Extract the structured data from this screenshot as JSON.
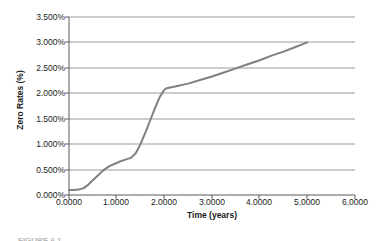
{
  "figure": {
    "caption_fragment": "FIGURE 6.1"
  },
  "chart_data": {
    "type": "line",
    "title": "",
    "xlabel": "Time (years)",
    "ylabel": "Zero Rates (%)",
    "xlim": [
      0.0,
      6.0
    ],
    "ylim": [
      0.0,
      3.5
    ],
    "xticks": [
      0.0,
      1.0,
      2.0,
      3.0,
      4.0,
      5.0,
      6.0
    ],
    "xtick_labels": [
      "0.0000",
      "1.0000",
      "2.0000",
      "3.0000",
      "4.0000",
      "5.0000",
      "6.0000"
    ],
    "yticks": [
      0.0,
      0.5,
      1.0,
      1.5,
      2.0,
      2.5,
      3.0,
      3.5
    ],
    "ytick_labels": [
      "0.000%",
      "0.500%",
      "1.000%",
      "1.500%",
      "2.000%",
      "2.500%",
      "3.000%",
      "3.500%"
    ],
    "grid": "horizontal",
    "legend": "none",
    "series": [
      {
        "name": "Zero curve",
        "color": "#808080",
        "line_width": 2,
        "markers": "none",
        "x": [
          0.0,
          0.1,
          0.2,
          0.3,
          0.4,
          0.5,
          0.6,
          0.7,
          0.8,
          0.9,
          1.0,
          1.1,
          1.2,
          1.3,
          1.4,
          1.5,
          1.6,
          1.7,
          1.8,
          1.9,
          2.0,
          2.05,
          2.1,
          2.2,
          2.3,
          2.4,
          2.5,
          2.75,
          3.0,
          3.25,
          3.5,
          3.75,
          4.0,
          4.25,
          4.5,
          4.75,
          5.0
        ],
        "y": [
          0.1,
          0.1,
          0.11,
          0.13,
          0.2,
          0.29,
          0.38,
          0.47,
          0.54,
          0.59,
          0.63,
          0.67,
          0.7,
          0.73,
          0.82,
          1.0,
          1.22,
          1.46,
          1.7,
          1.92,
          2.07,
          2.1,
          2.11,
          2.13,
          2.15,
          2.17,
          2.19,
          2.26,
          2.33,
          2.41,
          2.49,
          2.57,
          2.65,
          2.74,
          2.82,
          2.91,
          3.0
        ]
      }
    ]
  }
}
